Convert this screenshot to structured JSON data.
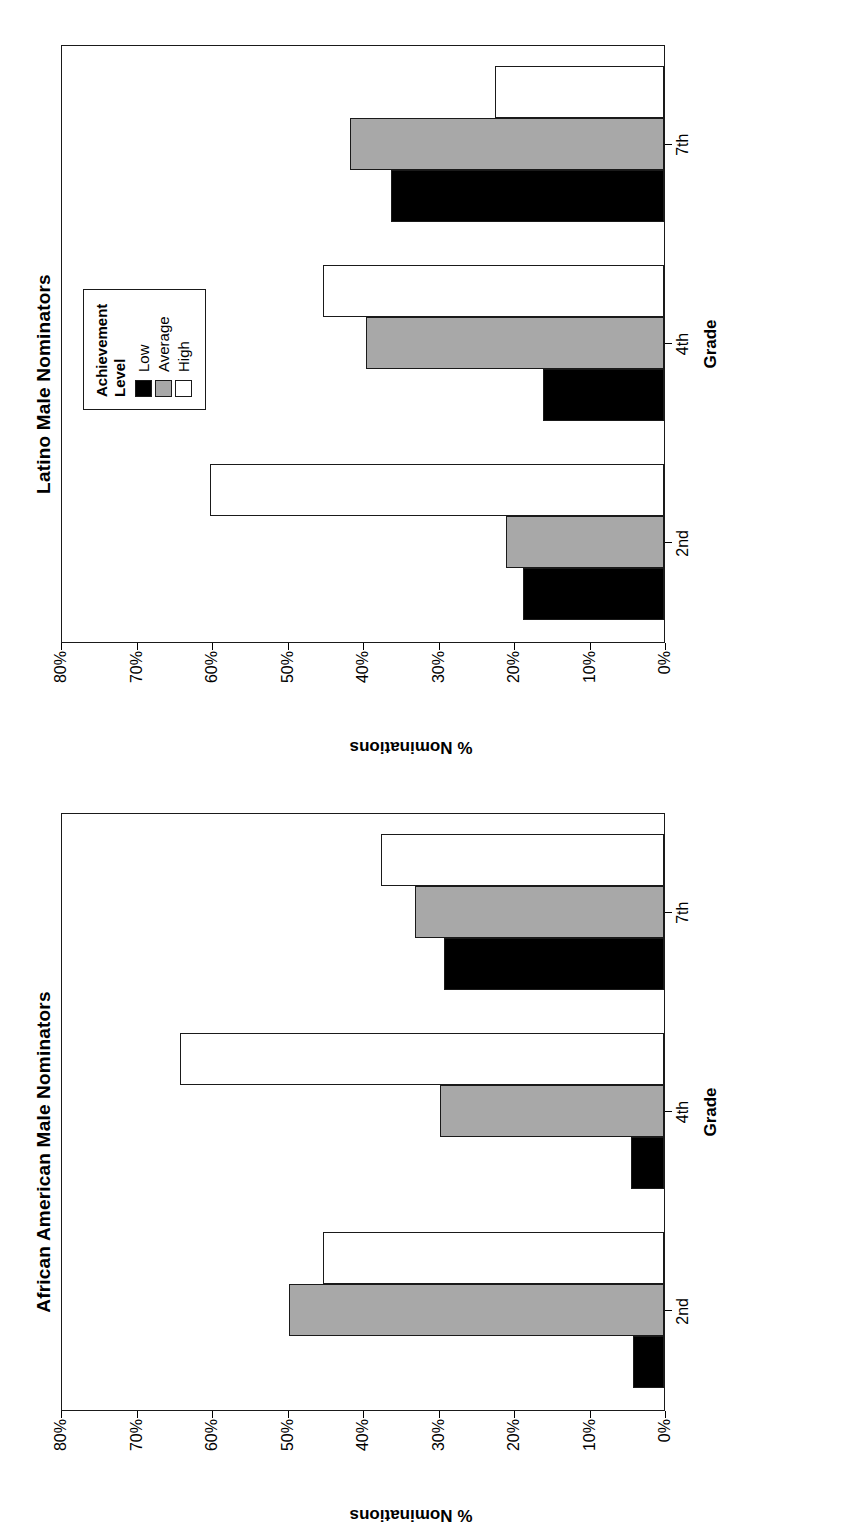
{
  "figure": {
    "orientation": "rotated-90-ccw",
    "panels": [
      "latino",
      "african_american"
    ]
  },
  "legend": {
    "title_line1": "Achievement",
    "title_line2": "Level",
    "items": [
      {
        "label": "Low",
        "color": "#000000"
      },
      {
        "label": "Average",
        "color": "#a8a8a8"
      },
      {
        "label": "High",
        "color": "#ffffff"
      }
    ]
  },
  "axis": {
    "yticks": [
      "80%",
      "70%",
      "60%",
      "50%",
      "40%",
      "30%",
      "20%",
      "10%",
      "0%"
    ],
    "ylabel": "% Nominations",
    "xlabel": "Grade",
    "xticks": [
      "2nd",
      "4th",
      "7th"
    ]
  },
  "chart_data": [
    {
      "type": "bar",
      "title": "Latino Male Nominators",
      "categories": [
        "2nd",
        "4th",
        "7th"
      ],
      "series": [
        {
          "name": "Low",
          "color": "#000000",
          "values": [
            18.7,
            16.0,
            36.2
          ]
        },
        {
          "name": "Average",
          "color": "#a8a8a8",
          "values": [
            21.0,
            39.6,
            41.6
          ]
        },
        {
          "name": "High",
          "color": "#ffffff",
          "values": [
            60.3,
            45.2,
            22.4
          ]
        }
      ],
      "xlabel": "Grade",
      "ylabel": "% Nominations",
      "ylim": [
        0,
        80
      ],
      "ytick_step": 10,
      "grid": false,
      "legend_position": "top-left"
    },
    {
      "type": "bar",
      "title": "African American Male Nominators",
      "categories": [
        "2nd",
        "4th",
        "7th"
      ],
      "series": [
        {
          "name": "Low",
          "color": "#000000",
          "values": [
            4.1,
            4.4,
            29.2
          ]
        },
        {
          "name": "Average",
          "color": "#a8a8a8",
          "values": [
            49.7,
            29.7,
            33.0
          ]
        },
        {
          "name": "High",
          "color": "#ffffff",
          "values": [
            45.2,
            64.2,
            37.5
          ]
        }
      ],
      "xlabel": "Grade",
      "ylabel": "% Nominations",
      "ylim": [
        0,
        80
      ],
      "ytick_step": 10,
      "grid": false,
      "legend_position": "none"
    }
  ]
}
